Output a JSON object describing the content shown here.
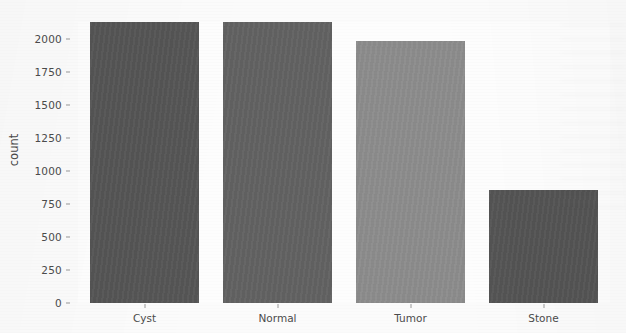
{
  "chart_data": {
    "type": "bar",
    "title": "",
    "subtitle": "",
    "xlabel": "",
    "ylabel": "count",
    "categories": [
      "Cyst",
      "Normal",
      "Tumor",
      "Stone"
    ],
    "values": [
      2130,
      2130,
      1985,
      856
    ],
    "series": [
      {
        "name": "count",
        "values": [
          2130,
          2130,
          1985,
          856
        ]
      }
    ],
    "bar_colors": [
      "#565656",
      "#626262",
      "#8d8d8d",
      "#555555"
    ],
    "ylim": [
      0,
      2130
    ],
    "y_ticks": [
      0,
      250,
      500,
      750,
      1000,
      1250,
      1500,
      1750,
      2000
    ],
    "y_tick_labels": [
      "0",
      "250",
      "500",
      "750",
      "1000",
      "1250",
      "1500",
      "1750",
      "2000"
    ],
    "grid": false,
    "legend": null,
    "legend_position": "none"
  },
  "figure": {
    "background_color": "#fbfbfb",
    "plot_background_color": "#fdfdfd",
    "tick_color": "#9a9a9a",
    "text_color": "#4c4c4c"
  }
}
